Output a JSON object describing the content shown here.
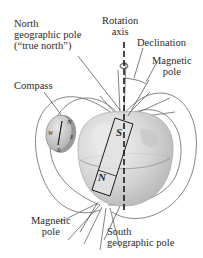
{
  "diagram": {
    "labels": {
      "north_geo_line1": "North",
      "north_geo_line2": "geographic pole",
      "north_geo_line3": "(“true north”)",
      "rotation_line1": "Rotation",
      "rotation_line2": "axis",
      "declination": "Declination",
      "magnetic_pole_top_line1": "Magnetic",
      "magnetic_pole_top_line2": "pole",
      "compass": "Compass",
      "magnetic_pole_bottom_line1": "Magnetic",
      "magnetic_pole_bottom_line2": "pole",
      "south_geo_line1": "South",
      "south_geo_line2": "geographic pole"
    },
    "magnet": {
      "top_pole": "S",
      "bottom_pole": "N"
    },
    "compass_letters": {
      "n": "N",
      "s": "S",
      "e": "E",
      "w": "W"
    },
    "colors": {
      "globe": "#d9d9d9",
      "globe_shade": "#bcbcbc",
      "field_lines": "#6e6e6e",
      "axis": "#1a1a1a",
      "magnet_fill": "#e6e6e6",
      "text": "#2a2a2a"
    }
  }
}
